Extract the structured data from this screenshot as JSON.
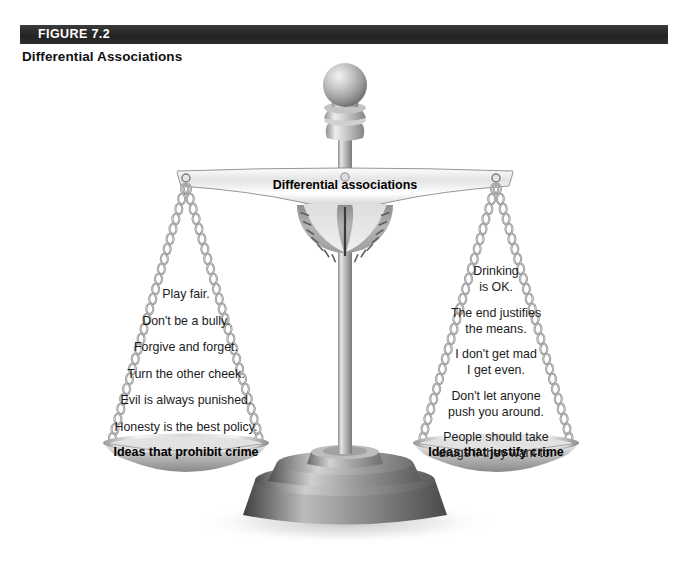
{
  "header": {
    "figure_number": "FIGURE 7.2",
    "title": "Differential Associations",
    "bar_color": "#2b2b2b",
    "figure_number_color": "#ffffff",
    "title_color": "#111111"
  },
  "illustration": {
    "type": "balance-scale",
    "beam_label": "Differential associations",
    "metal_color": "#b8b8b8",
    "metal_light": "#f0f0f0",
    "metal_dark": "#6e6e6e",
    "left_pan": {
      "label": "Ideas that prohibit crime",
      "items": [
        {
          "lines": [
            "Play fair."
          ]
        },
        {
          "lines": [
            "Don't be a bully."
          ]
        },
        {
          "lines": [
            "Forgive and forget."
          ]
        },
        {
          "lines": [
            "Turn the other cheek."
          ]
        },
        {
          "lines": [
            "Evil is always punished."
          ]
        },
        {
          "lines": [
            "Honesty is the best policy."
          ]
        }
      ]
    },
    "right_pan": {
      "label": "Ideas that justify crime",
      "items": [
        {
          "lines": [
            "Drinking",
            "is OK."
          ]
        },
        {
          "lines": [
            "The end justifies",
            "the means."
          ]
        },
        {
          "lines": [
            "I don't get mad",
            "I get even."
          ]
        },
        {
          "lines": [
            "Don't let anyone",
            "push you around."
          ]
        },
        {
          "lines": [
            "People should take",
            "drugs if they want to."
          ]
        }
      ]
    }
  }
}
